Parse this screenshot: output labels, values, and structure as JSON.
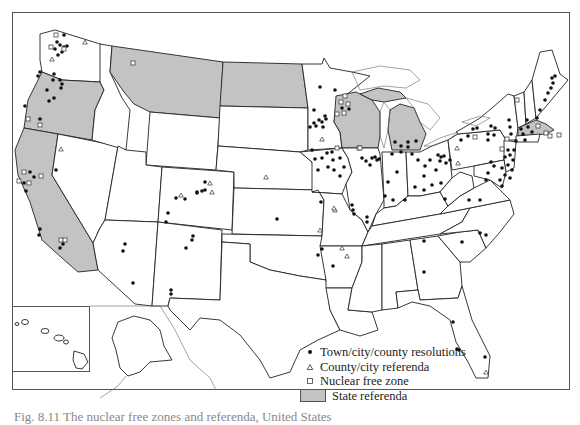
{
  "map": {
    "title": "Nuclear free zones and referenda in the United States",
    "insets": [
      "Hawaii",
      "Alaska"
    ]
  },
  "legend": {
    "items": [
      {
        "symbol": "filled-circle",
        "label": "Town/city/county resolutions"
      },
      {
        "symbol": "open-triangle",
        "label": "County/city referenda"
      },
      {
        "symbol": "open-square",
        "label": "Nuclear free zone"
      },
      {
        "symbol": "gray-swatch",
        "label": "State referenda"
      }
    ]
  },
  "state_referenda": [
    "Washington (partial)",
    "Oregon",
    "California",
    "Montana",
    "North Dakota",
    "Wisconsin",
    "Michigan",
    "Massachusetts"
  ],
  "colors": {
    "state_referenda_fill": "#c3c3c3",
    "marker": "#111111",
    "border": "#222222"
  },
  "caption": "Fig. 8.11 The nuclear free zones and referenda, United States"
}
